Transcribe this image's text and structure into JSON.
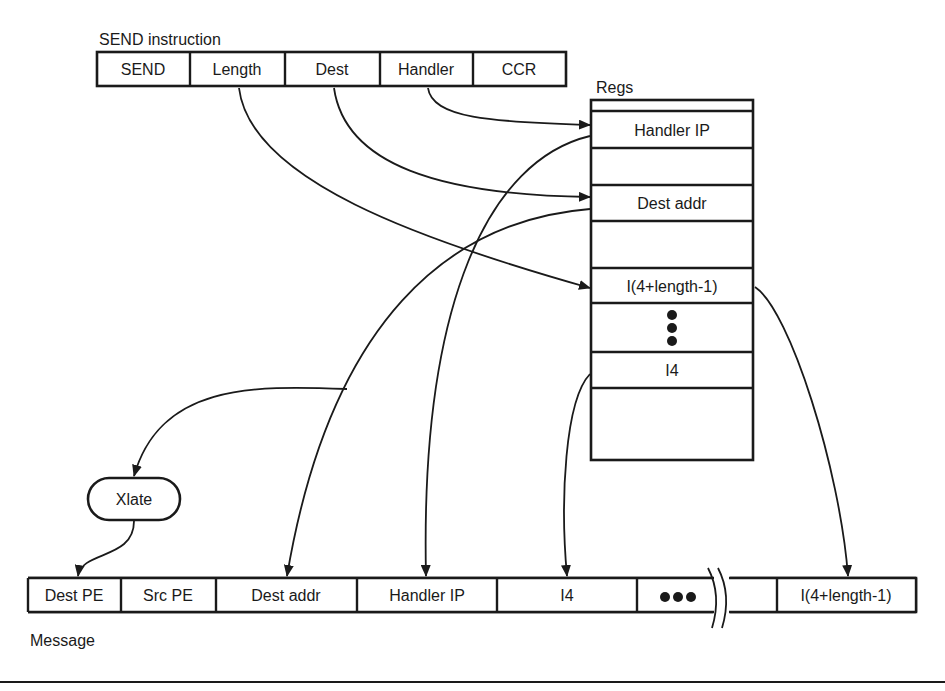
{
  "send_instruction": {
    "title": "SEND instruction",
    "fields": [
      "SEND",
      "Length",
      "Dest",
      "Handler",
      "CCR"
    ]
  },
  "regs": {
    "title": "Regs",
    "rows": [
      "",
      "Handler IP",
      "",
      "Dest addr",
      "",
      "I(4+length-1)",
      "",
      "I4",
      ""
    ],
    "ellipsis": "vertical-dots"
  },
  "xlate": {
    "label": "Xlate"
  },
  "message": {
    "title": "Message",
    "fields": [
      "Dest PE",
      "Src PE",
      "Dest addr",
      "Handler IP",
      "I4",
      "●●●",
      "",
      "I(4+length-1)"
    ]
  },
  "connections": [
    {
      "from": "send_instruction.Handler",
      "to": "regs.Handler IP"
    },
    {
      "from": "send_instruction.Dest",
      "to": "regs.Dest addr"
    },
    {
      "from": "send_instruction.Length",
      "to": "regs.I(4+length-1)"
    },
    {
      "from": "regs.Dest addr",
      "to": "xlate"
    },
    {
      "from": "xlate",
      "to": "message.Dest PE"
    },
    {
      "from": "regs.Dest addr",
      "to": "message.Dest addr"
    },
    {
      "from": "regs.Handler IP",
      "to": "message.Handler IP"
    },
    {
      "from": "regs.I4",
      "to": "message.I4"
    },
    {
      "from": "regs.I(4+length-1)",
      "to": "message.I(4+length-1)"
    }
  ],
  "colors": {
    "ink": "#1a1a1a",
    "background": "#ffffff"
  }
}
